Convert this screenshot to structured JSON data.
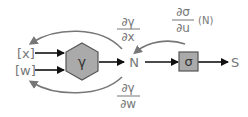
{
  "diagram": {
    "inputs": [
      {
        "label": "[x]"
      },
      {
        "label": "[w]"
      }
    ],
    "hexagon_node": {
      "label": "γ",
      "fill": "#aaaaaa"
    },
    "sum_node": {
      "label": "N"
    },
    "activation_node": {
      "label": "σ",
      "fill": "#aaaaaa"
    },
    "output_node": {
      "label": "S"
    },
    "gradients": {
      "dgamma_dx": {
        "num": "∂γ",
        "den": "∂x"
      },
      "dgamma_dw": {
        "num": "∂γ",
        "den": "∂w"
      },
      "dsigma_du": {
        "num": "∂σ",
        "den": "∂u",
        "suffix": "(N)"
      }
    },
    "colors": {
      "forward_arrow": "#111111",
      "backward_arrow": "#777777",
      "text": "#777777"
    }
  }
}
